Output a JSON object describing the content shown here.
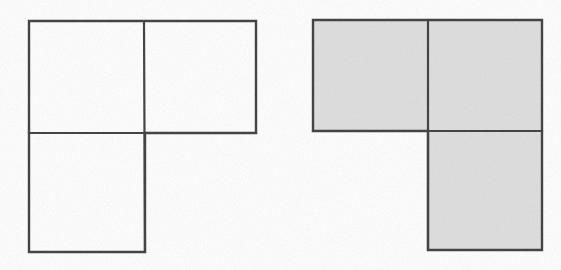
{
  "page": {
    "background_color": "#ffffff",
    "width": 561,
    "height": 270
  },
  "style": {
    "stroke_color": "#3a3a3a",
    "stroke_width": 2.2,
    "fill_unshaded": "#ffffff",
    "fill_shaded": "#dedede",
    "paper_color": "#ffffff"
  },
  "figures": [
    {
      "id": "left-figure",
      "name": "unshaded-tromino",
      "label": "",
      "shaded": false,
      "fill": "#ffffff",
      "orientation": "L-tromino: top-left, top-right, bottom-left",
      "outline_points": "29,21 256,21 256,133 145,133 145,252 29,252",
      "bounds": {
        "x": 29,
        "y": 21,
        "width": 227,
        "height": 231
      },
      "squares": [
        {
          "name": "top-left-square",
          "x": 29,
          "y": 21,
          "width": 115,
          "height": 112
        },
        {
          "name": "top-right-square",
          "x": 144,
          "y": 21,
          "width": 112,
          "height": 112
        },
        {
          "name": "bottom-left-square",
          "x": 29,
          "y": 133,
          "width": 116,
          "height": 119
        }
      ],
      "internal_lines": [
        {
          "name": "vertical-divider",
          "x1": 144,
          "y1": 21,
          "x2": 145,
          "y2": 252
        },
        {
          "name": "horizontal-divider",
          "x1": 29,
          "y1": 133,
          "x2": 256,
          "y2": 133
        }
      ]
    },
    {
      "id": "right-figure",
      "name": "shaded-tromino",
      "label": "",
      "shaded": true,
      "fill": "#dedede",
      "orientation": "Mirrored L-tromino: top-left, top-right, bottom-right",
      "outline_points": "313,20 542,20 542,250 428,250 428,131 313,131",
      "bounds": {
        "x": 313,
        "y": 20,
        "width": 229,
        "height": 230
      },
      "squares": [
        {
          "name": "top-left-square",
          "x": 313,
          "y": 20,
          "width": 115,
          "height": 111
        },
        {
          "name": "top-right-square",
          "x": 428,
          "y": 20,
          "width": 114,
          "height": 111
        },
        {
          "name": "bottom-right-square",
          "x": 428,
          "y": 131,
          "width": 114,
          "height": 119
        }
      ],
      "internal_lines": [
        {
          "name": "vertical-divider",
          "x1": 428,
          "y1": 20,
          "x2": 428,
          "y2": 250
        },
        {
          "name": "horizontal-divider",
          "x1": 313,
          "y1": 131,
          "x2": 542,
          "y2": 131
        }
      ]
    }
  ]
}
